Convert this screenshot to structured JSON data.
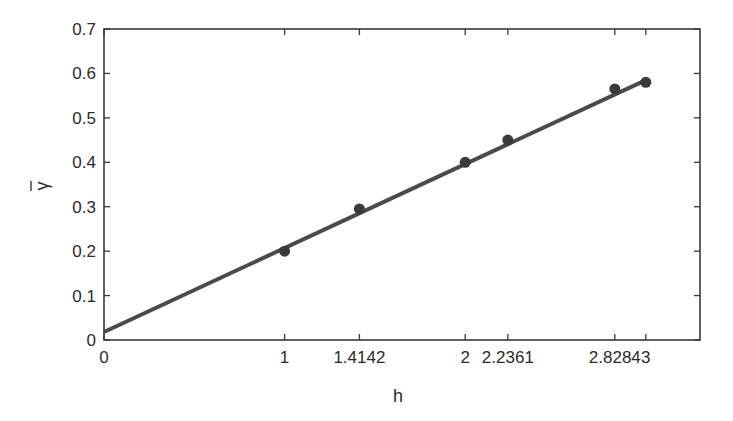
{
  "chart_data": {
    "type": "scatter",
    "title": "",
    "xlabel": "h",
    "ylabel": "γ̄",
    "xlim": [
      0,
      3.3
    ],
    "ylim": [
      0,
      0.7
    ],
    "grid": false,
    "legend": null,
    "x_ticks": [
      0,
      1,
      1.4142,
      2,
      2.2361,
      2.8284,
      3
    ],
    "x_tick_labels": [
      "0",
      "1",
      "1.4142",
      "2",
      "2.2361",
      "2.8284",
      "3"
    ],
    "y_ticks": [
      0,
      0.1,
      0.2,
      0.3,
      0.4,
      0.5,
      0.6,
      0.7
    ],
    "y_tick_labels": [
      "0",
      "0.1",
      "0.2",
      "0.3",
      "0.4",
      "0.5",
      "0.6",
      "0.7"
    ],
    "series": [
      {
        "name": "empirical semivariogram",
        "kind": "scatter",
        "color": "#3a3a3a",
        "x": [
          1,
          1.4142,
          2,
          2.2361,
          2.8284,
          3
        ],
        "y": [
          0.2,
          0.295,
          0.4,
          0.45,
          0.565,
          0.58
        ]
      },
      {
        "name": "linear fit",
        "kind": "line",
        "color": "#4a4a4a",
        "x": [
          0,
          3
        ],
        "y": [
          0.018,
          0.585
        ]
      }
    ]
  },
  "colors": {
    "axis": "#3a3a3a",
    "marker": "#3a3a3a",
    "fit_line": "#4a4a4a",
    "text": "#2b2b2b"
  }
}
